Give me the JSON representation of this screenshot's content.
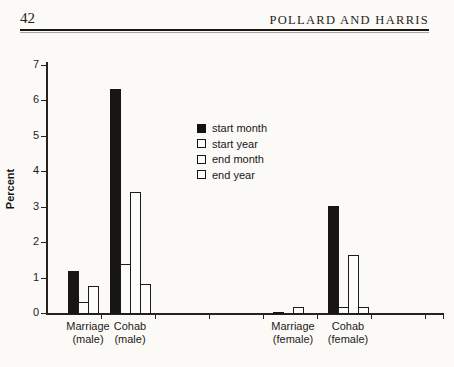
{
  "page": {
    "number": "42",
    "running_head": "POLLARD AND HARRIS"
  },
  "chart_data": {
    "type": "bar",
    "title": "",
    "xlabel": "",
    "ylabel": "Percent",
    "ylim": [
      0,
      7
    ],
    "yticks": [
      0,
      1,
      2,
      3,
      4,
      5,
      6,
      7
    ],
    "grid": false,
    "legend_position": "center-top-inside",
    "categories": [
      "Marriage (male)",
      "Cohab (male)",
      "Marriage (female)",
      "Cohab (female)"
    ],
    "category_label_lines": [
      [
        "Marriage",
        "(male)"
      ],
      [
        "Cohab",
        "(male)"
      ],
      [
        "Marriage",
        "(female)"
      ],
      [
        "Cohab",
        "(female)"
      ]
    ],
    "series": [
      {
        "name": "start month",
        "values": [
          1.2,
          6.35,
          0.05,
          3.05
        ]
      },
      {
        "name": "start year",
        "values": [
          0.35,
          1.4,
          0.0,
          0.2
        ]
      },
      {
        "name": "end month",
        "values": [
          0.8,
          3.45,
          0.2,
          1.65
        ]
      },
      {
        "name": "end year",
        "values": [
          0.0,
          0.85,
          0.0,
          0.2
        ]
      }
    ],
    "colors": {
      "filled_bar": "#171615",
      "open_bar_fill": "#fcfcf9",
      "open_bar_border": "#1d1c1a",
      "axis": "#24221f",
      "paper_background": "#fbfaf7"
    }
  }
}
